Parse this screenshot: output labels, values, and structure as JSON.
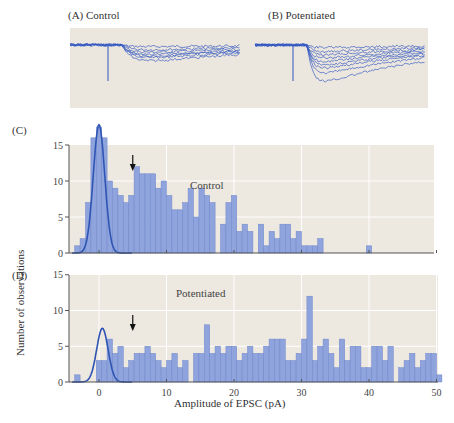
{
  "panels": {
    "a_label": "(A)  Control",
    "b_label": "(B)  Potentiated",
    "c_label": "(C)",
    "d_label": "(D)"
  },
  "colors": {
    "bar_fill": "#8fa4dc",
    "bar_stroke": "#6f86cc",
    "curve": "#2f55b4",
    "trace": "#3357c0",
    "plot_bg": "#ede8e0",
    "grid": "#ffffff",
    "axis": "#555555"
  },
  "chart_data": [
    {
      "type": "bar",
      "title": "Control",
      "panel": "C",
      "xlabel": "Amplitude of EPSC (pA)",
      "ylabel": "Number of observations",
      "xlim": [
        -4.5,
        50.5
      ],
      "ylim": [
        0,
        17
      ],
      "xticks": [
        0,
        10,
        20,
        30,
        40,
        50
      ],
      "yticks": [
        0,
        5,
        10,
        15
      ],
      "bin_width": 0.8,
      "bin_start": -3.6,
      "values": [
        1,
        2,
        7,
        16,
        17.5,
        16,
        10,
        9,
        8,
        7,
        8,
        12,
        11,
        11,
        11,
        9,
        10,
        8,
        6,
        6,
        7,
        9,
        5,
        9,
        8,
        7,
        0,
        4,
        7,
        8,
        3,
        4,
        3,
        0,
        4,
        1,
        3,
        2,
        4,
        4,
        2,
        3,
        1,
        1,
        1,
        2,
        0,
        0,
        0,
        0,
        0,
        0,
        0,
        0,
        1
      ],
      "gaussian_fit": {
        "mean": 0,
        "sd": 0.85,
        "peak": 17.8
      },
      "arrow_at": 5,
      "grid": true
    },
    {
      "type": "bar",
      "title": "Potentiated",
      "panel": "D",
      "xlabel": "Amplitude of EPSC (pA)",
      "ylabel": "Number of observations",
      "xlim": [
        -4.5,
        50.5
      ],
      "ylim": [
        0,
        15
      ],
      "xticks": [
        0,
        10,
        20,
        30,
        40,
        50
      ],
      "yticks": [
        0,
        5,
        10,
        15
      ],
      "bin_width": 0.8,
      "bin_start": -3.6,
      "values": [
        1,
        0,
        0,
        0,
        3,
        3,
        6,
        4,
        5,
        2,
        3,
        4,
        4,
        5,
        4,
        3,
        2,
        3,
        4,
        2,
        3,
        0,
        4,
        4,
        8,
        4,
        5,
        4,
        5,
        5,
        3,
        4,
        5,
        4,
        4,
        5,
        6,
        6,
        6,
        3,
        3,
        4,
        6,
        12,
        3,
        5,
        6,
        4,
        2,
        6,
        3,
        5,
        5,
        2,
        2,
        5,
        5,
        3,
        5,
        0,
        2,
        3,
        4,
        2,
        3,
        4,
        4,
        1,
        4,
        0,
        1,
        2,
        1,
        0,
        1,
        1,
        2,
        1,
        0,
        2,
        1,
        0,
        1,
        1
      ],
      "gaussian_fit": {
        "mean": 0.5,
        "sd": 0.85,
        "peak": 7.5
      },
      "arrow_at": 5,
      "grid": true
    }
  ],
  "traces": {
    "control_label": "Control",
    "potentiated_label": "Potentiated"
  },
  "annotations": {
    "c_text": "Control",
    "d_text": "Potentiated",
    "xlabel": "Amplitude of EPSC (pA)",
    "ylabel": "Number of observations"
  }
}
